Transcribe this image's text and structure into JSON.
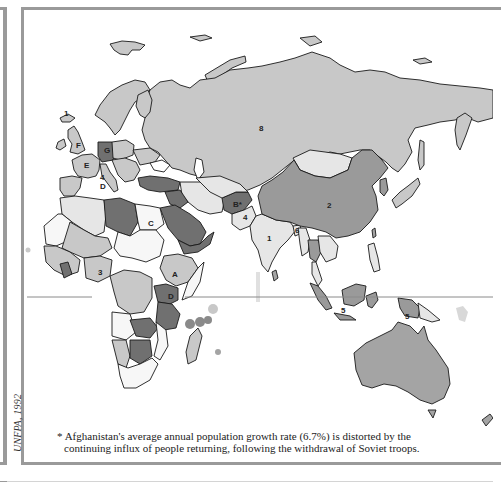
{
  "map": {
    "type": "choropleth",
    "region_shown": "Europe, Africa, Asia, Australia",
    "fill_shades": {
      "white": "#f7f7f7",
      "very_light": "#e6e6e6",
      "light": "#c8c8c8",
      "medium": "#a4a4a4",
      "dark": "#9a9a9a",
      "darkest": "#707070"
    },
    "outline_color": "#1a1a1a",
    "equator_color": "#8a8a8a",
    "frame_color": "#9a9a9a",
    "labels": [
      {
        "text": "1",
        "x": 66,
        "y": 116,
        "near": "Iceland"
      },
      {
        "text": "F",
        "x": 78,
        "y": 148,
        "near": "United Kingdom"
      },
      {
        "text": "G",
        "x": 107,
        "y": 152,
        "near": "Germany"
      },
      {
        "text": "E",
        "x": 87,
        "y": 167,
        "near": "France"
      },
      {
        "text": "4",
        "x": 102,
        "y": 180,
        "near": "Italy"
      },
      {
        "text": "D",
        "x": 102,
        "y": 189,
        "near": "Italy"
      },
      {
        "text": "8",
        "x": 261,
        "y": 130,
        "near": "Russia"
      },
      {
        "text": "2",
        "x": 329,
        "y": 207,
        "near": "China"
      },
      {
        "text": "B*",
        "x": 237,
        "y": 207,
        "near": "Afghanistan"
      },
      {
        "text": "4",
        "x": 245,
        "y": 219,
        "near": "Pakistan"
      },
      {
        "text": "1",
        "x": 269,
        "y": 240,
        "near": "India"
      },
      {
        "text": "6",
        "x": 297,
        "y": 233,
        "near": "Bangladesh"
      },
      {
        "text": "C",
        "x": 151,
        "y": 226,
        "near": "Egypt"
      },
      {
        "text": "3",
        "x": 100,
        "y": 275,
        "near": "Nigeria"
      },
      {
        "text": "A",
        "x": 175,
        "y": 277,
        "near": "Ethiopia"
      },
      {
        "text": "D",
        "x": 171,
        "y": 299,
        "near": "Kenya"
      },
      {
        "text": "5",
        "x": 343,
        "y": 313,
        "near": "Indonesia"
      },
      {
        "text": "5",
        "x": 407,
        "y": 319,
        "near": "Papua New Guinea"
      }
    ]
  },
  "credit": "UNFPA, 1992",
  "footnote": {
    "line1": "* Afghanistan's average annual population growth rate (6.7%) is distorted by the",
    "line2": "continuing influx of people returning, following the withdrawal of Soviet troops."
  }
}
